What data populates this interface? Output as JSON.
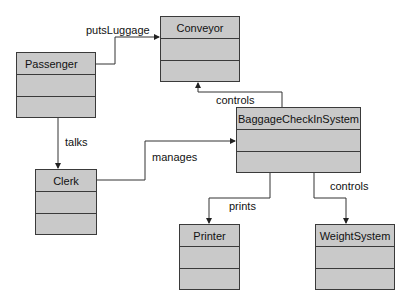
{
  "diagram": {
    "type": "UML class diagram",
    "classes": [
      {
        "id": "conveyor",
        "name": "Conveyor"
      },
      {
        "id": "passenger",
        "name": "Passenger"
      },
      {
        "id": "baggage",
        "name": "BaggageCheckInSystem"
      },
      {
        "id": "clerk",
        "name": "Clerk"
      },
      {
        "id": "printer",
        "name": "Printer"
      },
      {
        "id": "weight",
        "name": "WeightSystem"
      }
    ],
    "associations": [
      {
        "from": "Passenger",
        "to": "Conveyor",
        "label": "putsLuggage"
      },
      {
        "from": "Passenger",
        "to": "Clerk",
        "label": "talks"
      },
      {
        "from": "BaggageCheckInSystem",
        "to": "Conveyor",
        "label": "controls"
      },
      {
        "from": "Clerk",
        "to": "BaggageCheckInSystem",
        "label": "manages"
      },
      {
        "from": "BaggageCheckInSystem",
        "to": "Printer",
        "label": "prints"
      },
      {
        "from": "BaggageCheckInSystem",
        "to": "WeightSystem",
        "label": "controls"
      }
    ]
  },
  "colors": {
    "class_fill": "#c9c9c9",
    "line": "#3a3a3a"
  }
}
